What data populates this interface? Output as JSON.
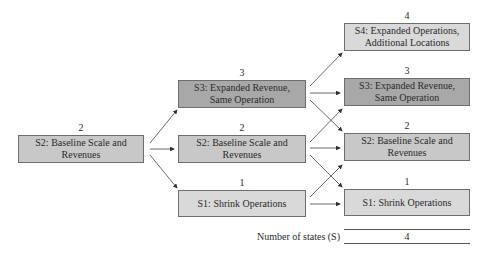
{
  "column0": {
    "s2": {
      "number": "2",
      "label": "S2: Baseline Scale and Revenues"
    }
  },
  "column1": {
    "s3": {
      "number": "3",
      "label": "S3: Expanded Revenue, Same Operation"
    },
    "s2": {
      "number": "2",
      "label": "S2: Baseline Scale and Revenues"
    },
    "s1": {
      "number": "1",
      "label": "S1: Shrink Operations"
    }
  },
  "column2": {
    "s4": {
      "number": "4",
      "label": "S4: Expanded Operations, Additional Locations"
    },
    "s3": {
      "number": "3",
      "label": "S3: Expanded Revenue, Same Operation"
    },
    "s2": {
      "number": "2",
      "label": "S2: Baseline Scale and Revenues"
    },
    "s1": {
      "number": "1",
      "label": "S1: Shrink Operations"
    }
  },
  "footer": {
    "label": "Number of states (S)",
    "value": "4"
  },
  "colors": {
    "light_fill": "#d9d9d9",
    "mid_fill": "#c8c8c8",
    "dark_fill": "#a8a8a8",
    "border": "#6e6e6e",
    "arrow": "#333333"
  }
}
